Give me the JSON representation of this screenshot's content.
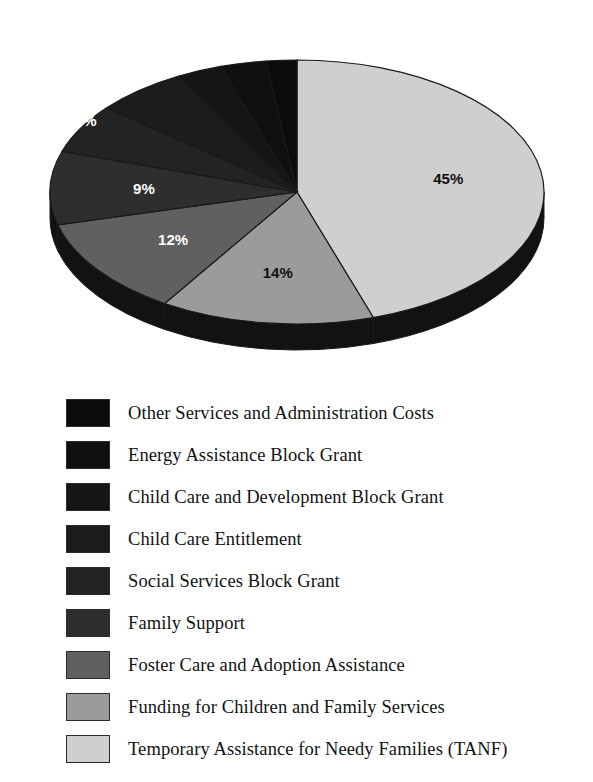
{
  "chart_data": {
    "type": "pie",
    "title": "",
    "xlabel": "",
    "ylabel": "",
    "units": "percent",
    "legend_position": "bottom",
    "grid": false,
    "categories": [
      "Temporary Assistance for Needy Families (TANF)",
      "Funding for Children and Family Services",
      "Foster Care and Adoption Assistance",
      "Family Support",
      "Social Services Block Grant",
      "Child Care Entitlement",
      "Child Care and Development Block Grant",
      "Energy Assistance Block Grant",
      "Other Services and Administration Costs"
    ],
    "values": [
      45,
      14,
      12,
      9,
      6,
      6,
      3,
      3,
      2
    ],
    "labels": [
      "45%",
      "14%",
      "12%",
      "9%",
      "6%",
      "6%",
      "3%",
      "3%",
      "2%"
    ],
    "colors": [
      "#cfcfcf",
      "#9b9b9b",
      "#606060",
      "#2e2e2e",
      "#232323",
      "#1c1c1c",
      "#151515",
      "#101010",
      "#0b0b0b"
    ],
    "slice_label_colors": [
      "#111111",
      "#111111",
      "#ffffff",
      "#ffffff",
      "#ffffff",
      "#ffffff",
      "#ffffff",
      "#ffffff",
      "#ffffff"
    ],
    "side_wall_color": "#121212",
    "outline_color": "#1a1a1a",
    "start_angle_deg": 0,
    "direction": "clockwise"
  },
  "legend": {
    "items": [
      {
        "label": "Other Services and Administration Costs",
        "color": "#0b0b0b",
        "value": 2
      },
      {
        "label": "Energy Assistance Block Grant",
        "color": "#101010",
        "value": 3
      },
      {
        "label": "Child Care and Development Block Grant",
        "color": "#151515",
        "value": 3
      },
      {
        "label": "Child Care Entitlement",
        "color": "#1c1c1c",
        "value": 6
      },
      {
        "label": "Social Services Block Grant",
        "color": "#232323",
        "value": 6
      },
      {
        "label": "Family Support",
        "color": "#2e2e2e",
        "value": 9
      },
      {
        "label": "Foster Care and Adoption Assistance",
        "color": "#606060",
        "value": 12
      },
      {
        "label": "Funding for Children and Family Services",
        "color": "#9b9b9b",
        "value": 14
      },
      {
        "label": "Temporary Assistance for Needy Families (TANF)",
        "color": "#cfcfcf",
        "value": 45
      }
    ]
  }
}
